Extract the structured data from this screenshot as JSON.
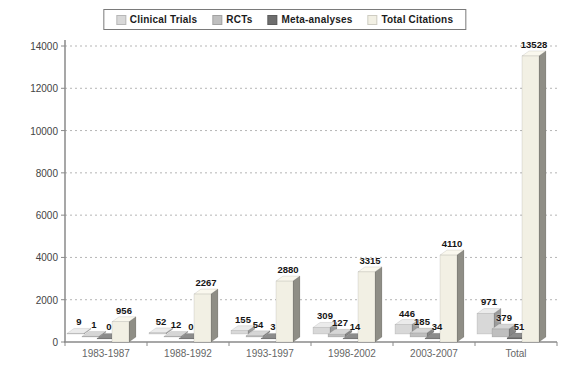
{
  "chart_data": {
    "type": "bar",
    "style": "3d-grouped",
    "title": "",
    "xlabel": "",
    "ylabel": "",
    "categories": [
      "1983-1987",
      "1988-1992",
      "1993-1997",
      "1998-2002",
      "2003-2007",
      "Total"
    ],
    "series": [
      {
        "name": "Clinical Trials",
        "values": [
          9,
          52,
          155,
          309,
          446,
          971
        ],
        "color": "#d8d8d8",
        "color_top": "#ebebeb",
        "color_side": "#9a9a9a"
      },
      {
        "name": "RCTs",
        "values": [
          1,
          12,
          54,
          127,
          185,
          379
        ],
        "color": "#bfbfbf",
        "color_top": "#d6d6d6",
        "color_side": "#868686"
      },
      {
        "name": "Meta-analyses",
        "values": [
          0,
          0,
          3,
          14,
          34,
          51
        ],
        "color": "#6e6e6e",
        "color_top": "#8c8c8c",
        "color_side": "#4d4d4d"
      },
      {
        "name": "Total Citations",
        "values": [
          956,
          2267,
          2880,
          3315,
          4110,
          13528
        ],
        "color": "#f2f0e4",
        "color_top": "#faf8ee",
        "color_side": "#8f8e86"
      }
    ],
    "ylim": [
      0,
      14000
    ],
    "yticks": [
      0,
      2000,
      4000,
      6000,
      8000,
      10000,
      12000,
      14000
    ],
    "grid": true,
    "gridline_style": "dashed",
    "legend_position": "top-center",
    "colors": {
      "gridline": "#b5b5b5",
      "axis": "#8a8a8a",
      "value_label": "#151515",
      "tick_label": "#444444",
      "category_label": "#666666",
      "legend_border": "#7a7a7a",
      "background": "#ffffff"
    }
  }
}
